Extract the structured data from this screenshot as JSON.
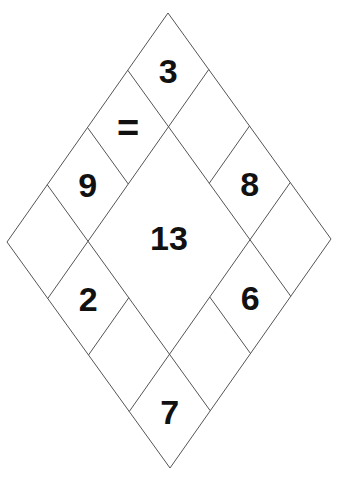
{
  "puzzle": {
    "type": "number-diamond",
    "grid_size": 4,
    "outer_vertices": {
      "top": [
        168,
        13
      ],
      "left": [
        7,
        242
      ],
      "right": [
        331,
        239
      ],
      "bottom": [
        171,
        468
      ]
    },
    "line_color": "#555555",
    "text_color": "#111111",
    "center": {
      "label": "13",
      "merged_cells": [
        [
          1,
          1
        ],
        [
          1,
          2
        ],
        [
          2,
          1
        ],
        [
          2,
          2
        ]
      ]
    },
    "cells": [
      {
        "row": 0,
        "col": 0,
        "label": "3"
      },
      {
        "row": 0,
        "col": 1,
        "label": ""
      },
      {
        "row": 0,
        "col": 2,
        "label": "8"
      },
      {
        "row": 0,
        "col": 3,
        "label": ""
      },
      {
        "row": 1,
        "col": 0,
        "label": "="
      },
      {
        "row": 1,
        "col": 3,
        "label": "6"
      },
      {
        "row": 2,
        "col": 0,
        "label": "9"
      },
      {
        "row": 2,
        "col": 3,
        "label": ""
      },
      {
        "row": 3,
        "col": 0,
        "label": ""
      },
      {
        "row": 3,
        "col": 1,
        "label": "2"
      },
      {
        "row": 3,
        "col": 2,
        "label": ""
      },
      {
        "row": 3,
        "col": 3,
        "label": "7"
      }
    ]
  }
}
